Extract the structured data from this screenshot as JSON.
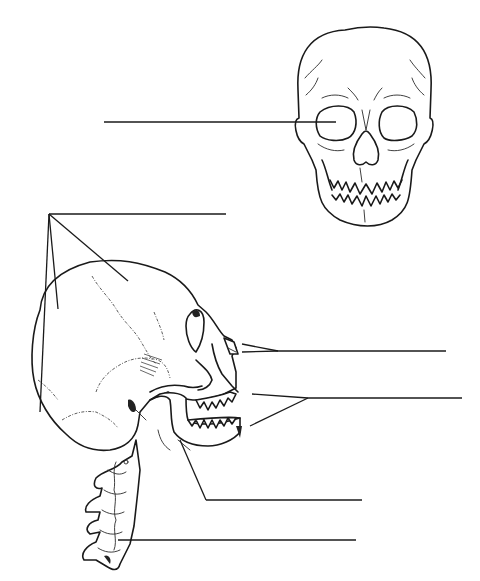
{
  "diagram": {
    "title": "",
    "type": "unlabeled anatomy worksheet",
    "colors": {
      "ink": "#1a1a1a",
      "background": "#ffffff"
    },
    "views": [
      {
        "id": "anterior-skull",
        "description": "Skull, anterior view"
      },
      {
        "id": "lateral-skull",
        "description": "Skull, lateral view with cervical spine"
      }
    ],
    "label_lines": [
      {
        "id": "label-1",
        "text": "",
        "points_to": "orbit (anterior view)"
      },
      {
        "id": "label-2",
        "text": "",
        "points_to": "cranial bones (three leaders)"
      },
      {
        "id": "label-3",
        "text": "",
        "points_to": "nasal bone"
      },
      {
        "id": "label-4",
        "text": "",
        "points_to": "teeth / maxilla and mandible (two leaders)"
      },
      {
        "id": "label-5",
        "text": "",
        "points_to": "mandible"
      },
      {
        "id": "label-6",
        "text": "",
        "points_to": "cervical vertebrae"
      }
    ]
  }
}
